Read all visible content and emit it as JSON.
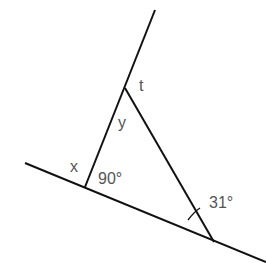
{
  "diagram": {
    "type": "geometry-triangle",
    "labels": {
      "t": "t",
      "y": "y",
      "x": "x",
      "right_angle": "90°",
      "acute_angle": "31°"
    },
    "colors": {
      "line": "#111111",
      "text": "#555555",
      "background": "#ffffff"
    },
    "lines": {
      "transversal": {
        "x1": 155,
        "y1": 10,
        "x2": 85,
        "y2": 187
      },
      "base": {
        "x1": 25,
        "y1": 163,
        "x2": 266,
        "y2": 262
      },
      "hypotenuse": {
        "x1": 125,
        "y1": 88,
        "x2": 214,
        "y2": 242
      }
    },
    "angles": {
      "right_angle_value": 90,
      "acute_angle_value": 31
    }
  }
}
